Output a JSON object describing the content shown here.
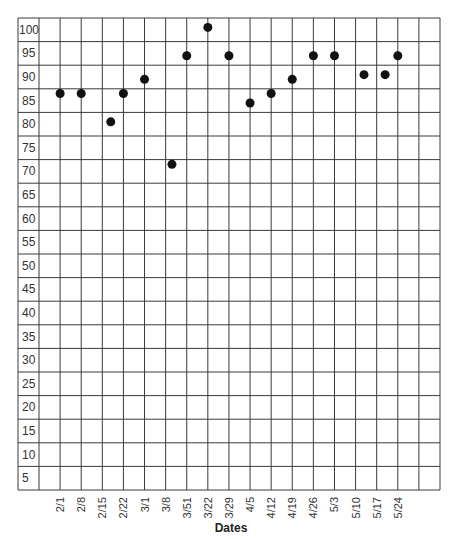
{
  "chart_data": {
    "type": "scatter",
    "title": "",
    "xlabel": "Dates",
    "ylabel": "",
    "categories": [
      "2/1",
      "2/8",
      "2/15",
      "2/22",
      "3/1",
      "3/8",
      "3/51",
      "3/22",
      "3/29",
      "4/5",
      "4/12",
      "4/19",
      "4/26",
      "5/3",
      "5/10",
      "5/17",
      "5/24"
    ],
    "values": [
      84,
      84,
      78,
      84,
      87,
      69,
      92,
      98,
      92,
      82,
      84,
      87,
      92,
      92,
      88,
      88,
      92
    ],
    "x_offsets": [
      0,
      0,
      0.4,
      0,
      0,
      0.3,
      0,
      0,
      0,
      0,
      0,
      0,
      0,
      0,
      0.4,
      0.4,
      0
    ],
    "yticks": [
      100,
      95,
      90,
      85,
      80,
      75,
      70,
      65,
      60,
      55,
      50,
      45,
      40,
      35,
      30,
      25,
      20,
      15,
      10,
      5
    ],
    "ylim": [
      0,
      100
    ],
    "grid": true,
    "legend": null
  }
}
